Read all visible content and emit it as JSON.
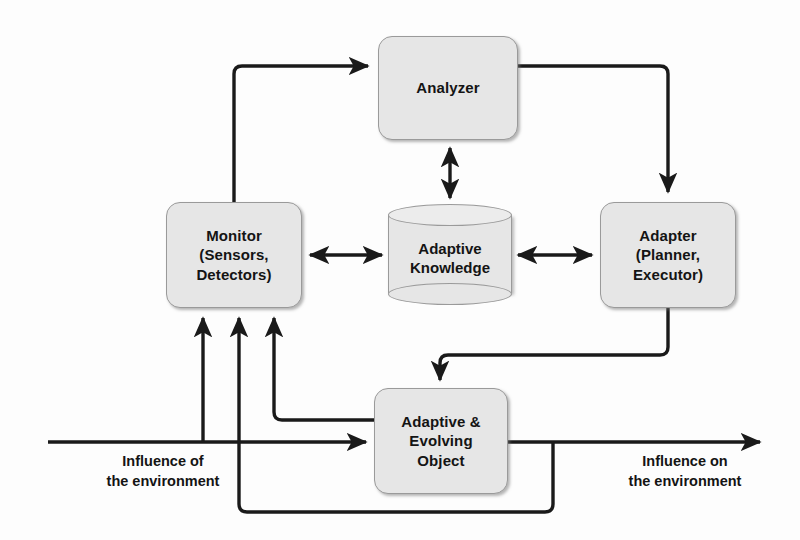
{
  "diagram": {
    "background_color": "#fdfdfd",
    "node_fill_color": "#e6e6e6",
    "node_border_color": "#9a9a9a",
    "line_color": "#1a1a1a",
    "text_color": "#141414"
  },
  "nodes": {
    "analyzer": {
      "label": "Analyzer",
      "shape": "rounded-rectangle"
    },
    "monitor": {
      "label": "Monitor\n(Sensors,\nDetectors)",
      "shape": "rounded-rectangle"
    },
    "knowledge": {
      "label": "Adaptive\nKnowledge",
      "shape": "cylinder"
    },
    "adapter": {
      "label": "Adapter\n(Planner,\nExecutor)",
      "shape": "rounded-rectangle"
    },
    "object": {
      "label": "Adaptive &\nEvolving\nObject",
      "shape": "rounded-rectangle"
    }
  },
  "captions": {
    "influence_of": "Influence of\nthe environment",
    "influence_on": "Influence on\nthe environment"
  },
  "connections": [
    {
      "id": "monitor-to-analyzer",
      "from": "monitor",
      "to": "analyzer",
      "arrows": "single"
    },
    {
      "id": "analyzer-to-adapter",
      "from": "analyzer",
      "to": "adapter",
      "arrows": "single"
    },
    {
      "id": "analyzer-knowledge",
      "from": "analyzer",
      "to": "knowledge",
      "arrows": "double"
    },
    {
      "id": "monitor-knowledge",
      "from": "monitor",
      "to": "knowledge",
      "arrows": "double"
    },
    {
      "id": "knowledge-adapter",
      "from": "knowledge",
      "to": "adapter",
      "arrows": "double"
    },
    {
      "id": "adapter-to-object",
      "from": "adapter",
      "to": "object",
      "arrows": "single"
    },
    {
      "id": "object-to-monitor",
      "from": "object",
      "to": "monitor",
      "arrows": "single"
    },
    {
      "id": "object-feedback-to-monitor",
      "from": "object",
      "to": "monitor",
      "arrows": "single"
    },
    {
      "id": "environment-in",
      "from": "environment",
      "to": "object",
      "arrows": "single"
    },
    {
      "id": "environment-in-to-monitor",
      "from": "environment",
      "to": "monitor",
      "arrows": "single"
    },
    {
      "id": "environment-out",
      "from": "object",
      "to": "environment",
      "arrows": "single"
    }
  ]
}
